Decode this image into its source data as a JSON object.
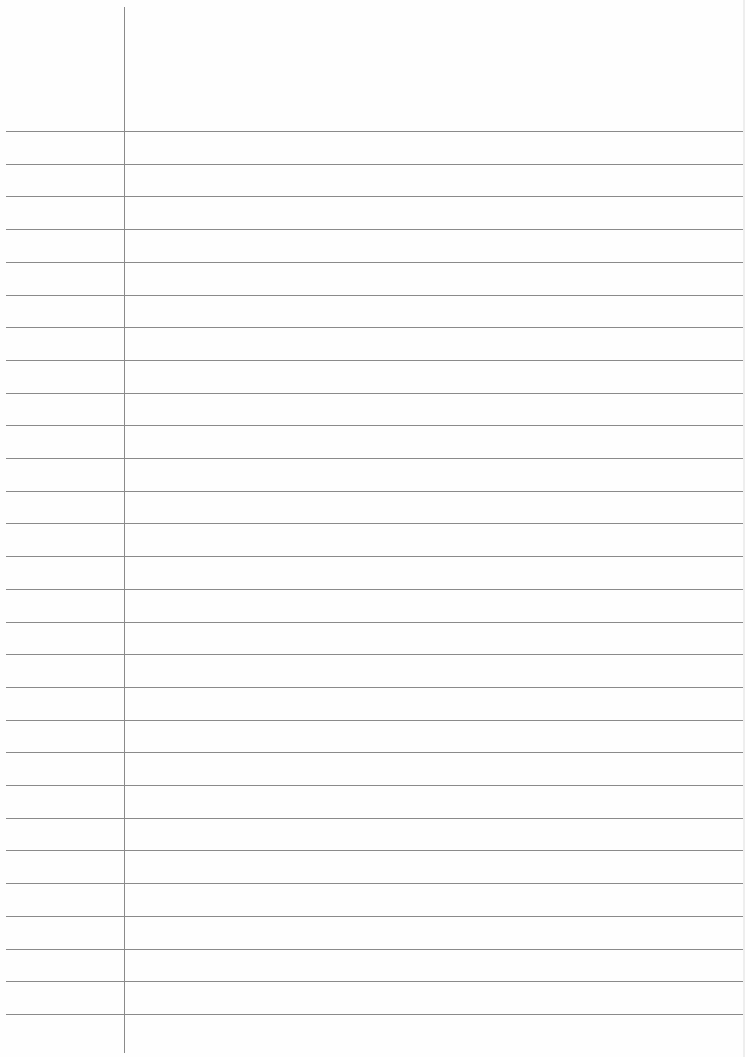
{
  "page": {
    "type": "lined-paper",
    "background_color": "#fefefe",
    "line_color": "#8a8a8a",
    "margin_line_x": 124,
    "first_line_y": 131,
    "line_spacing": 32.7,
    "line_count": 28
  }
}
